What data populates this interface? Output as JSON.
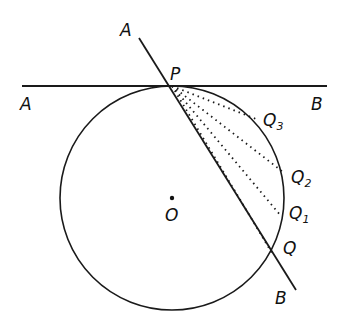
{
  "diagram": {
    "colors": {
      "stroke": "#1a1a1a",
      "background": "#ffffff"
    },
    "labels": {
      "secant_top": "A",
      "secant_bottom": "B",
      "tangent_left": "A",
      "tangent_right": "B",
      "point_P": "P",
      "center": "O",
      "Q": "Q",
      "Q1": "Q",
      "Q1_sub": "1",
      "Q2": "Q",
      "Q2_sub": "2",
      "Q3": "Q",
      "Q3_sub": "3"
    },
    "circle": {
      "cx": 172,
      "cy": 198,
      "r": 112
    },
    "tangent_line": {
      "x1": 22,
      "y1": 86,
      "x2": 327,
      "y2": 86
    },
    "secant_line": {
      "x1": 139,
      "y1": 38,
      "x2": 296,
      "y2": 290
    },
    "points": {
      "P": [
        172,
        86
      ],
      "Q": [
        272,
        253
      ],
      "Q1": [
        281,
        216
      ],
      "Q2": [
        283,
        172
      ],
      "Q3": [
        256,
        119
      ]
    }
  }
}
